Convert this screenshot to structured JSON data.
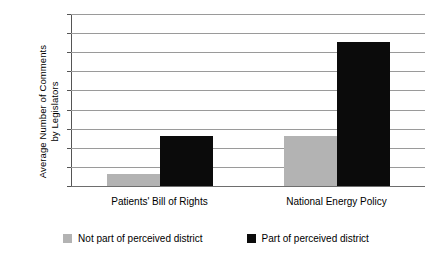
{
  "chart_data": {
    "type": "bar",
    "title": "",
    "xlabel": "",
    "ylabel_lines": [
      "Average Number of Comments",
      "by Legislators"
    ],
    "ylabel": "Average Number of Comments by Legislators",
    "categories": [
      "Patients' Bill of Rights",
      "National Energy Policy"
    ],
    "series": [
      {
        "name": "Not part of perceived district",
        "color": "#b3b3b3",
        "values": [
          0.65,
          2.6
        ]
      },
      {
        "name": "Part of perceived district",
        "color": "#0b0b0b",
        "values": [
          2.6,
          7.55
        ]
      }
    ],
    "ylim": [
      0,
      9
    ],
    "yticks": [
      0,
      1,
      2,
      3,
      4,
      5,
      6,
      7,
      8,
      9
    ],
    "ytick_labels": [
      "0",
      "1",
      "2",
      "3",
      "4",
      "5",
      "6",
      "7",
      "8",
      "9"
    ],
    "grid": true,
    "legend_position": "bottom"
  },
  "colors": {
    "series_a": "#b3b3b3",
    "series_b": "#0b0b0b",
    "grid": "#9a9a9a",
    "axis": "#555555",
    "background": "#ffffff"
  }
}
